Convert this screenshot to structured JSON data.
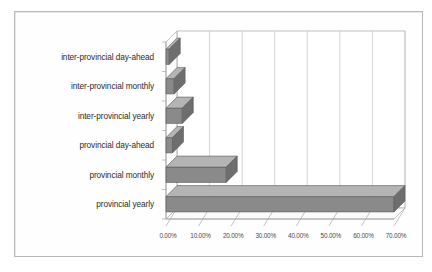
{
  "chart_data": {
    "type": "bar",
    "orientation": "horizontal",
    "style": "3d",
    "title": "",
    "subtitle": "",
    "xlabel": "",
    "ylabel": "",
    "categories": [
      "inter-provincial day-ahead",
      "inter-provincial monthly",
      "inter-provincial yearly",
      "provincial day-ahead",
      "provincial monthly",
      "provincial yearly"
    ],
    "values": [
      1.0,
      2.5,
      5.0,
      2.0,
      18.5,
      70.0
    ],
    "value_format": "percent",
    "xlim": [
      0,
      70
    ],
    "xticks": [
      0,
      10,
      20,
      30,
      40,
      50,
      60,
      70
    ],
    "xtick_labels": [
      "0.00%",
      "10.00%",
      "20.00%",
      "30.00%",
      "40.00%",
      "50.00%",
      "60.00%",
      "70.00%"
    ],
    "grid": true,
    "grid_axis": "x",
    "legend": false,
    "legend_position": "none",
    "series": [
      {
        "name": "share",
        "values": [
          1.0,
          2.5,
          5.0,
          2.0,
          18.5,
          70.0
        ]
      }
    ]
  },
  "colors": {
    "bar_front": "#8a8a8a",
    "bar_top": "#b4b4b4",
    "bar_side": "#6e6e6e",
    "bar_outline": "#5a5a5a",
    "gridline": "#c9c9c9",
    "axis_line": "#a8a8a8",
    "wall": "#ffffff",
    "floor": "#fbfbfb",
    "frame": "#b9b9b9",
    "label_text": "#2b2b2b",
    "tick_text": "#4a4a4a"
  }
}
